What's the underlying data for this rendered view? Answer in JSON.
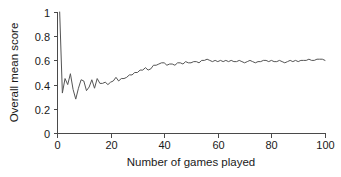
{
  "chart_data": {
    "type": "line",
    "title": "",
    "subtitle": "",
    "xlabel": "Number of games played",
    "ylabel": "Overall mean score",
    "xlim": [
      0,
      100
    ],
    "ylim": [
      0,
      1
    ],
    "xticks": [
      0,
      20,
      40,
      60,
      80,
      100
    ],
    "xtick_labels": [
      "0",
      "20",
      "40",
      "60",
      "80",
      "100"
    ],
    "yticks": [
      0,
      0.2,
      0.4,
      0.6,
      0.8,
      1
    ],
    "ytick_labels": [
      "0",
      "0.2",
      "0.4",
      "0.6",
      "0.8",
      "1"
    ],
    "grid": false,
    "legend": false,
    "legend_position": "none",
    "line_color": "#555555",
    "axis_color": "#4a4a4a",
    "background_color": "#ffffff",
    "annotations": [],
    "series": [
      {
        "name": "Overall mean score",
        "x": [
          1,
          2,
          3,
          4,
          5,
          6,
          7,
          8,
          9,
          10,
          11,
          12,
          13,
          14,
          15,
          16,
          17,
          18,
          19,
          20,
          21,
          22,
          23,
          24,
          25,
          26,
          27,
          28,
          29,
          30,
          31,
          32,
          33,
          34,
          35,
          36,
          37,
          38,
          39,
          40,
          41,
          42,
          43,
          44,
          45,
          46,
          47,
          48,
          49,
          50,
          51,
          52,
          53,
          54,
          55,
          56,
          57,
          58,
          59,
          60,
          61,
          62,
          63,
          64,
          65,
          66,
          67,
          68,
          69,
          70,
          71,
          72,
          73,
          74,
          75,
          76,
          77,
          78,
          79,
          80,
          81,
          82,
          83,
          84,
          85,
          86,
          87,
          88,
          89,
          90,
          91,
          92,
          93,
          94,
          95,
          96,
          97,
          98,
          99,
          100
        ],
        "values": [
          1.0,
          0.33,
          0.45,
          0.4,
          0.49,
          0.36,
          0.28,
          0.37,
          0.44,
          0.43,
          0.35,
          0.38,
          0.44,
          0.37,
          0.45,
          0.41,
          0.41,
          0.42,
          0.4,
          0.42,
          0.43,
          0.46,
          0.43,
          0.45,
          0.45,
          0.46,
          0.48,
          0.48,
          0.5,
          0.5,
          0.52,
          0.52,
          0.54,
          0.52,
          0.53,
          0.56,
          0.56,
          0.57,
          0.58,
          0.58,
          0.56,
          0.57,
          0.57,
          0.56,
          0.58,
          0.58,
          0.57,
          0.59,
          0.58,
          0.58,
          0.59,
          0.59,
          0.58,
          0.6,
          0.6,
          0.61,
          0.6,
          0.59,
          0.6,
          0.59,
          0.6,
          0.59,
          0.6,
          0.59,
          0.6,
          0.59,
          0.59,
          0.6,
          0.59,
          0.58,
          0.59,
          0.6,
          0.59,
          0.58,
          0.59,
          0.59,
          0.6,
          0.6,
          0.59,
          0.6,
          0.59,
          0.59,
          0.6,
          0.59,
          0.58,
          0.59,
          0.6,
          0.59,
          0.6,
          0.59,
          0.6,
          0.6,
          0.6,
          0.61,
          0.6,
          0.6,
          0.61,
          0.61,
          0.61,
          0.6
        ]
      }
    ]
  },
  "layout": {
    "plot_left": 57,
    "plot_right": 325,
    "plot_top": 12,
    "plot_bottom": 133
  }
}
